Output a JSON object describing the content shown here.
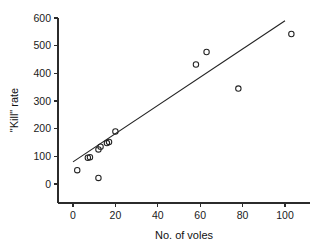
{
  "chart_data": {
    "type": "scatter",
    "title": "",
    "xlabel": "No. of voles",
    "ylabel": "\"Kill\" rate",
    "xlim": [
      -8,
      112
    ],
    "ylim": [
      -40,
      620
    ],
    "xticks": [
      0,
      20,
      40,
      60,
      80,
      100
    ],
    "xticklabels": [
      "0",
      "20",
      "40",
      "60",
      "80",
      "100"
    ],
    "yticks": [
      0,
      100,
      200,
      300,
      400,
      500,
      600
    ],
    "yticklabels": [
      "0",
      "100",
      "200",
      "300",
      "400",
      "500",
      "600"
    ],
    "grid": false,
    "legend": null,
    "marker": "open-circle",
    "marker_color": "#222222",
    "line_color": "#222222",
    "x": [
      2,
      7,
      8,
      12,
      12,
      13,
      16,
      17,
      20,
      58,
      63,
      78,
      103
    ],
    "y": [
      50,
      95,
      97,
      22,
      125,
      135,
      148,
      152,
      190,
      432,
      477,
      345,
      542
    ],
    "points": [
      {
        "x": 2,
        "y": 50
      },
      {
        "x": 7,
        "y": 95
      },
      {
        "x": 8,
        "y": 97
      },
      {
        "x": 12,
        "y": 22
      },
      {
        "x": 12,
        "y": 125
      },
      {
        "x": 13,
        "y": 135
      },
      {
        "x": 16,
        "y": 148
      },
      {
        "x": 17,
        "y": 152
      },
      {
        "x": 20,
        "y": 190
      },
      {
        "x": 58,
        "y": 432
      },
      {
        "x": 63,
        "y": 477
      },
      {
        "x": 78,
        "y": 345
      },
      {
        "x": 103,
        "y": 542
      }
    ],
    "series": [
      {
        "name": "observations",
        "type": "scatter",
        "values": [
          {
            "x": 2,
            "y": 50
          },
          {
            "x": 7,
            "y": 95
          },
          {
            "x": 8,
            "y": 97
          },
          {
            "x": 12,
            "y": 22
          },
          {
            "x": 12,
            "y": 125
          },
          {
            "x": 13,
            "y": 135
          },
          {
            "x": 16,
            "y": 148
          },
          {
            "x": 17,
            "y": 152
          },
          {
            "x": 20,
            "y": 190
          },
          {
            "x": 58,
            "y": 432
          },
          {
            "x": 63,
            "y": 477
          },
          {
            "x": 78,
            "y": 345
          },
          {
            "x": 103,
            "y": 542
          }
        ]
      },
      {
        "name": "regression-line",
        "type": "line",
        "endpoints": [
          {
            "x": 0,
            "y": 80
          },
          {
            "x": 100,
            "y": 590
          }
        ]
      }
    ]
  }
}
